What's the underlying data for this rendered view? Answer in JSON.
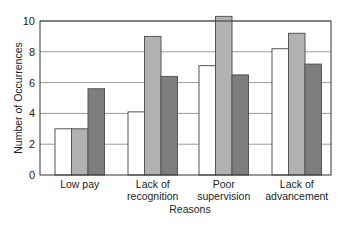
{
  "chart_data": {
    "type": "bar",
    "title": "",
    "xlabel": "Reasons",
    "ylabel": "Number of Occurrences",
    "ylim": [
      0,
      10
    ],
    "yticks": [
      0,
      2,
      4,
      6,
      8,
      10
    ],
    "grid": true,
    "legend": null,
    "categories": [
      [
        "Low pay"
      ],
      [
        "Lack of",
        "recognition"
      ],
      [
        "Poor",
        "supervision"
      ],
      [
        "Lack of",
        "advancement"
      ]
    ],
    "category_labels": [
      "Low pay",
      "Lack of recognition",
      "Poor supervision",
      "Lack of advancement"
    ],
    "series": [
      {
        "name": "Series 1",
        "color": "#ffffff",
        "values": [
          3.0,
          4.1,
          7.1,
          8.2
        ]
      },
      {
        "name": "Series 2",
        "color": "#b2b2b2",
        "values": [
          3.0,
          9.0,
          10.3,
          9.2
        ]
      },
      {
        "name": "Series 3",
        "color": "#7e7e7e",
        "values": [
          5.6,
          6.4,
          6.5,
          7.2
        ]
      }
    ]
  },
  "colors": {
    "grid": "#9a9a9a",
    "axis": "#333333",
    "bar_outline": "#555555"
  }
}
